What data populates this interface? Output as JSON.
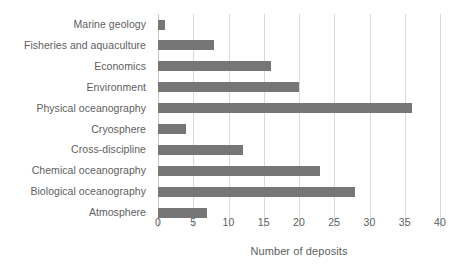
{
  "chart_data": {
    "type": "bar",
    "orientation": "horizontal",
    "title": "",
    "xlabel": "Number of deposits",
    "ylabel": "",
    "xlim": [
      0,
      40
    ],
    "xticks": [
      0,
      5,
      10,
      15,
      20,
      25,
      30,
      35,
      40
    ],
    "grid": "vertical",
    "legend": "none",
    "bar_color": "#767676",
    "grid_color": "#d9d9d9",
    "text_color": "#5e5e5e",
    "background": "#ffffff",
    "categories": [
      "Marine geology",
      "Fisheries and aquaculture",
      "Economics",
      "Environment",
      "Physical oceanography",
      "Cryosphere",
      "Cross-discipline",
      "Chemical oceanography",
      "Biological oceanography",
      "Atmosphere"
    ],
    "values": [
      1,
      8,
      16,
      20,
      36,
      4,
      12,
      23,
      28,
      7
    ]
  }
}
